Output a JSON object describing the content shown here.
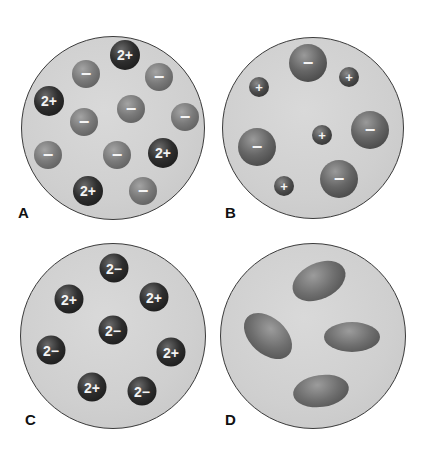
{
  "figure": {
    "panels": [
      {
        "label": "A",
        "description": "Ionic solution: 2+ cations and 1- anions",
        "dish": {
          "cx": 113,
          "cy": 128,
          "r": 92
        },
        "particles": [
          {
            "type": "cation2",
            "charge": "2+",
            "x": 125,
            "y": 55,
            "d": 30
          },
          {
            "type": "anion",
            "charge": "−",
            "x": 86,
            "y": 74,
            "d": 28
          },
          {
            "type": "anion",
            "charge": "−",
            "x": 159,
            "y": 77,
            "d": 28
          },
          {
            "type": "cation2",
            "charge": "2+",
            "x": 49,
            "y": 101,
            "d": 30
          },
          {
            "type": "anion",
            "charge": "−",
            "x": 131,
            "y": 109,
            "d": 28
          },
          {
            "type": "anion",
            "charge": "−",
            "x": 185,
            "y": 117,
            "d": 28
          },
          {
            "type": "anion",
            "charge": "−",
            "x": 84,
            "y": 122,
            "d": 28
          },
          {
            "type": "anion",
            "charge": "−",
            "x": 48,
            "y": 155,
            "d": 28
          },
          {
            "type": "anion",
            "charge": "−",
            "x": 117,
            "y": 155,
            "d": 28
          },
          {
            "type": "cation2",
            "charge": "2+",
            "x": 163,
            "y": 153,
            "d": 30
          },
          {
            "type": "cation2",
            "charge": "2+",
            "x": 88,
            "y": 191,
            "d": 30
          },
          {
            "type": "anion",
            "charge": "−",
            "x": 143,
            "y": 191,
            "d": 28
          }
        ]
      },
      {
        "label": "B",
        "description": "Ionic solution: small 1+ cations and large 1- anions",
        "dish": {
          "cx": 313,
          "cy": 128,
          "r": 91
        },
        "particles": [
          {
            "type": "biganion",
            "charge": "−",
            "x": 308,
            "y": 63,
            "d": 38
          },
          {
            "type": "cation1",
            "charge": "+",
            "x": 349,
            "y": 77,
            "d": 20
          },
          {
            "type": "cation1",
            "charge": "+",
            "x": 259,
            "y": 87,
            "d": 20
          },
          {
            "type": "biganion",
            "charge": "−",
            "x": 370,
            "y": 130,
            "d": 38
          },
          {
            "type": "cation1",
            "charge": "+",
            "x": 322,
            "y": 135,
            "d": 20
          },
          {
            "type": "biganion",
            "charge": "−",
            "x": 257,
            "y": 147,
            "d": 38
          },
          {
            "type": "biganion",
            "charge": "−",
            "x": 339,
            "y": 179,
            "d": 38
          },
          {
            "type": "cation1",
            "charge": "+",
            "x": 284,
            "y": 186,
            "d": 20
          }
        ]
      },
      {
        "label": "C",
        "description": "Ionic solution: 2+ cations and 2- anions",
        "dish": {
          "cx": 113,
          "cy": 336,
          "r": 93
        },
        "particles": [
          {
            "type": "anion2",
            "charge": "2−",
            "x": 114,
            "y": 268,
            "d": 29
          },
          {
            "type": "cation2",
            "charge": "2+",
            "x": 69,
            "y": 299,
            "d": 29
          },
          {
            "type": "cation2",
            "charge": "2+",
            "x": 154,
            "y": 297,
            "d": 29
          },
          {
            "type": "anion2",
            "charge": "2−",
            "x": 113,
            "y": 330,
            "d": 29
          },
          {
            "type": "anion2",
            "charge": "2−",
            "x": 51,
            "y": 350,
            "d": 29
          },
          {
            "type": "cation2",
            "charge": "2+",
            "x": 171,
            "y": 352,
            "d": 29
          },
          {
            "type": "cation2",
            "charge": "2+",
            "x": 92,
            "y": 387,
            "d": 29
          },
          {
            "type": "anion2",
            "charge": "2−",
            "x": 142,
            "y": 391,
            "d": 29
          }
        ]
      },
      {
        "label": "D",
        "description": "Molecular solution: neutral elongated molecules",
        "dish": {
          "cx": 313,
          "cy": 336,
          "r": 93
        },
        "particles": [
          {
            "type": "molecule",
            "x": 319,
            "y": 281,
            "w": 56,
            "h": 36,
            "rot": -25
          },
          {
            "type": "molecule",
            "x": 268,
            "y": 336,
            "w": 56,
            "h": 36,
            "rot": 42
          },
          {
            "type": "molecule",
            "x": 352,
            "y": 337,
            "w": 56,
            "h": 30,
            "rot": 0
          },
          {
            "type": "molecule",
            "x": 321,
            "y": 391,
            "w": 56,
            "h": 32,
            "rot": -8
          }
        ]
      }
    ]
  }
}
